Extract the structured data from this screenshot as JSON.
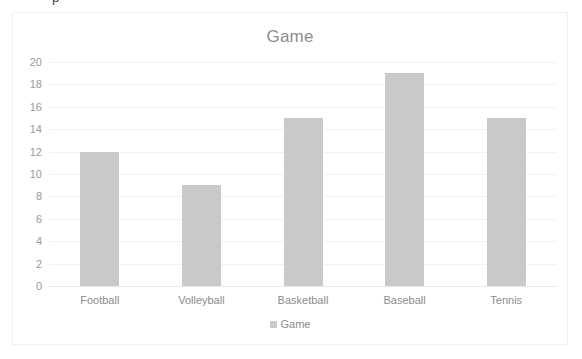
{
  "clipped_header": {
    "text": "p"
  },
  "chart_data": {
    "type": "bar",
    "title": "Game",
    "xlabel": "",
    "ylabel": "",
    "categories": [
      "Football",
      "Volleyball",
      "Basketball",
      "Baseball",
      "Tennis"
    ],
    "values": [
      12,
      9,
      15,
      19,
      15
    ],
    "series": [
      {
        "name": "Game",
        "values": [
          12,
          9,
          15,
          19,
          15
        ]
      }
    ],
    "ylim": [
      0,
      20
    ],
    "ytick_step": 2,
    "ytick_labels": [
      "20",
      "18",
      "16",
      "14",
      "12",
      "10",
      "8",
      "6",
      "4",
      "2",
      "0"
    ],
    "grid": true,
    "legend": {
      "position": "bottom",
      "entries": [
        {
          "label": "Game",
          "color": "#c9c9c9"
        }
      ]
    },
    "colors": {
      "bar": "#c9c9c9",
      "title_text": "#8c8c8c",
      "tick_text": "#9a9a9a",
      "gridline": "#f2f2f2",
      "plot_background": "#ffffff",
      "frame_border": "#f2f2f2"
    }
  }
}
